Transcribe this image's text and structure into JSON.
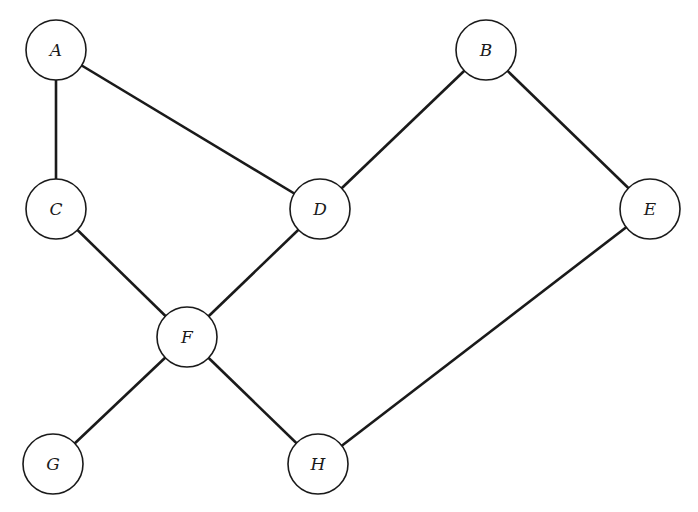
{
  "diagram": {
    "type": "undirected-graph",
    "node_radius": 30,
    "colors": {
      "stroke": "#1a1a1a",
      "fill": "#ffffff",
      "background": "#ffffff"
    },
    "nodes": [
      {
        "id": "A",
        "label": "A",
        "x": 56,
        "y": 50
      },
      {
        "id": "B",
        "label": "B",
        "x": 486,
        "y": 50
      },
      {
        "id": "C",
        "label": "C",
        "x": 56,
        "y": 209
      },
      {
        "id": "D",
        "label": "D",
        "x": 320,
        "y": 209
      },
      {
        "id": "E",
        "label": "E",
        "x": 650,
        "y": 209
      },
      {
        "id": "F",
        "label": "F",
        "x": 187,
        "y": 337
      },
      {
        "id": "G",
        "label": "G",
        "x": 53,
        "y": 464
      },
      {
        "id": "H",
        "label": "H",
        "x": 318,
        "y": 464
      }
    ],
    "edges": [
      [
        "A",
        "C"
      ],
      [
        "A",
        "D"
      ],
      [
        "B",
        "D"
      ],
      [
        "B",
        "E"
      ],
      [
        "C",
        "F"
      ],
      [
        "D",
        "F"
      ],
      [
        "F",
        "G"
      ],
      [
        "F",
        "H"
      ],
      [
        "E",
        "H"
      ]
    ]
  }
}
